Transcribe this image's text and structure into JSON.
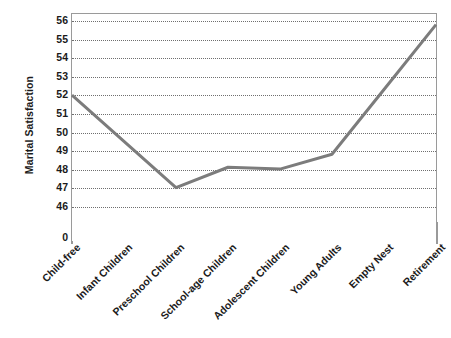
{
  "chart_data": {
    "type": "line",
    "title": "",
    "subtitle": "",
    "xlabel": "",
    "ylabel": "Marital Satisfaction",
    "categories": [
      "Child-free",
      "Infant Children",
      "Preschool Children",
      "School-age Children",
      "Adolescent Children",
      "Young Adults",
      "Empty Nest",
      "Retirement"
    ],
    "values": [
      52.0,
      49.5,
      47.0,
      48.1,
      48.0,
      48.8,
      52.3,
      55.8
    ],
    "series": [
      {
        "name": "Marital Satisfaction",
        "values": [
          52.0,
          49.5,
          47.0,
          48.1,
          48.0,
          48.8,
          52.3,
          55.8
        ]
      }
    ],
    "y_ticks": [
      0,
      46,
      47,
      48,
      49,
      50,
      51,
      52,
      53,
      54,
      55,
      56
    ],
    "y_axis_break": true,
    "ylim": [
      46,
      56
    ],
    "grid": true,
    "grid_style": "dotted",
    "legend": "none",
    "line_color": "#7c7c7c",
    "line_width": 3,
    "markers": "none",
    "background_color": "#ffffff",
    "axis_color": "#9a9a9a",
    "text_color": "#1b1b1b"
  },
  "axis": {
    "y_title": "Marital Satisfaction",
    "y_tick_labels": [
      "56",
      "55",
      "54",
      "53",
      "52",
      "51",
      "50",
      "49",
      "48",
      "47",
      "46",
      "0"
    ],
    "x_tick_labels": [
      "Child-free",
      "Infant Children",
      "Preschool Children",
      "School-age Children",
      "Adolescent Children",
      "Young Adults",
      "Empty Nest",
      "Retirement"
    ]
  }
}
